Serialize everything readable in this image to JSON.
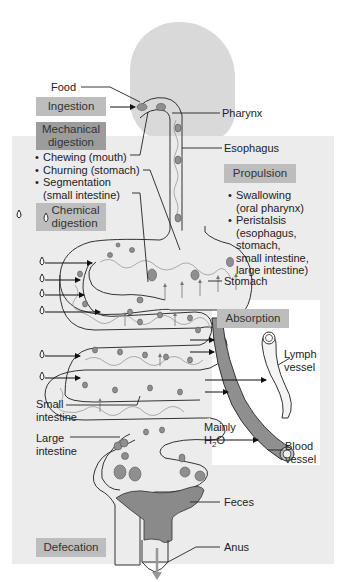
{
  "figure": {
    "labels": {
      "food": "Food",
      "pharynx": "Pharynx",
      "esophagus": "Esophagus",
      "stomach": "Stomach",
      "lymph_vessel": [
        "Lymph",
        "vessel"
      ],
      "small_intestine": [
        "Small",
        "intestine"
      ],
      "large_intestine": [
        "Large",
        "intestine"
      ],
      "mainly_h2o_line1": "Mainly",
      "mainly_h2o_h": "H",
      "mainly_h2o_sub": "2",
      "mainly_h2o_o": "O",
      "blood_vessel": [
        "Blood",
        "vessel"
      ],
      "feces": "Feces",
      "anus": "Anus"
    },
    "processes": {
      "ingestion": "Ingestion",
      "mechanical_digestion": [
        "Mechanical",
        "digestion"
      ],
      "mechanical_items": [
        "Chewing (mouth)",
        "Churning (stomach)",
        "Segmentation",
        "(small intestine)"
      ],
      "chemical_digestion": [
        "Chemical",
        "digestion"
      ],
      "propulsion": "Propulsion",
      "propulsion_items": [
        "Swallowing",
        "(oral pharynx)",
        "Peristalsis",
        "(esophagus,",
        "stomach,",
        "small intestine,",
        "large intestine)"
      ],
      "absorption": "Absorption",
      "defecation": "Defecation"
    },
    "colors": {
      "panel_bg": "#ececec",
      "box_light": "#bdbdbd",
      "box_dark": "#9c9c9c",
      "blood_vessel": "#8f8f8f",
      "lymph_vessel": "#f2f2f2",
      "feces": "#8a8a8a",
      "head_silhouette": "#d9d9d9"
    }
  }
}
